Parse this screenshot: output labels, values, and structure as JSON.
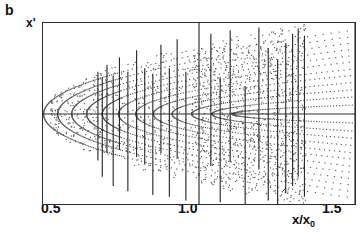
{
  "panel": {
    "label": "b"
  },
  "axes": {
    "ylabel": "x'",
    "xlabel_main": "x/x",
    "xlabel_sub": "0",
    "xticks": [
      "0.5",
      "1.0",
      "1.5"
    ]
  },
  "colors": {
    "ink": "#2b2b2b",
    "dot": "#555555",
    "background": "#ffffff"
  },
  "chart_data": {
    "type": "scatter",
    "title": "",
    "xlabel": "x/x_0",
    "ylabel": "x'",
    "xlim": [
      0.5,
      1.5
    ],
    "ylim": [
      -1.0,
      1.0
    ],
    "xticks": [
      0.5,
      1.0,
      1.5
    ],
    "grid": false,
    "legend": null,
    "series": [
      {
        "name": "dotted-parabolic-arcs",
        "type": "arc-family",
        "vertex_x": 0.5,
        "arc_vertices": [
          0.5,
          0.545,
          0.59,
          0.638,
          0.688,
          0.74,
          0.795,
          0.852,
          0.912,
          0.975,
          1.04,
          1.105
        ],
        "half_height_at_right": [
          0.93,
          0.86,
          0.79,
          0.72,
          0.65,
          0.58,
          0.5,
          0.43,
          0.35,
          0.27,
          0.19,
          0.1
        ]
      },
      {
        "name": "envelope-upper",
        "type": "parabola",
        "points_x": [
          0.5,
          0.6,
          0.7,
          0.8,
          0.9,
          1.0,
          1.1,
          1.2,
          1.3
        ],
        "points_y": [
          0.0,
          0.35,
          0.5,
          0.61,
          0.7,
          0.78,
          0.85,
          0.92,
          0.98
        ]
      },
      {
        "name": "envelope-lower",
        "type": "parabola",
        "points_x": [
          0.5,
          0.6,
          0.7,
          0.8,
          0.9,
          1.0,
          1.1,
          1.2,
          1.3
        ],
        "points_y": [
          0.0,
          -0.35,
          -0.5,
          -0.61,
          -0.7,
          -0.78,
          -0.85,
          -0.92,
          -0.98
        ]
      },
      {
        "name": "vertical-strands",
        "type": "vlines",
        "x": [
          0.676,
          0.69,
          0.705,
          0.725,
          0.745,
          0.772,
          0.8,
          0.826,
          0.852,
          0.878,
          0.905,
          0.93,
          0.958,
          1.0,
          1.038,
          1.068,
          1.1,
          1.148,
          1.192,
          1.222,
          1.252,
          1.278,
          1.3,
          1.318,
          1.338,
          1.5
        ],
        "y_top": [
          0.46,
          0.4,
          0.54,
          0.42,
          0.62,
          0.46,
          0.7,
          0.5,
          0.44,
          0.76,
          0.5,
          0.82,
          0.46,
          1.0,
          0.88,
          0.4,
          0.92,
          0.3,
          0.95,
          0.72,
          0.6,
          0.78,
          0.88,
          0.94,
          0.86,
          1.0
        ],
        "y_bottom": [
          -0.52,
          -0.7,
          -0.44,
          -0.8,
          -0.4,
          -0.86,
          -0.48,
          -0.56,
          -0.9,
          -0.44,
          -0.92,
          -0.5,
          -0.96,
          -1.0,
          -0.58,
          -0.98,
          -0.54,
          -1.0,
          -0.62,
          -0.96,
          -1.0,
          -0.88,
          -0.8,
          -0.7,
          -0.92,
          -1.0
        ]
      },
      {
        "name": "axis-line",
        "type": "hline",
        "y": 0.0
      }
    ]
  }
}
